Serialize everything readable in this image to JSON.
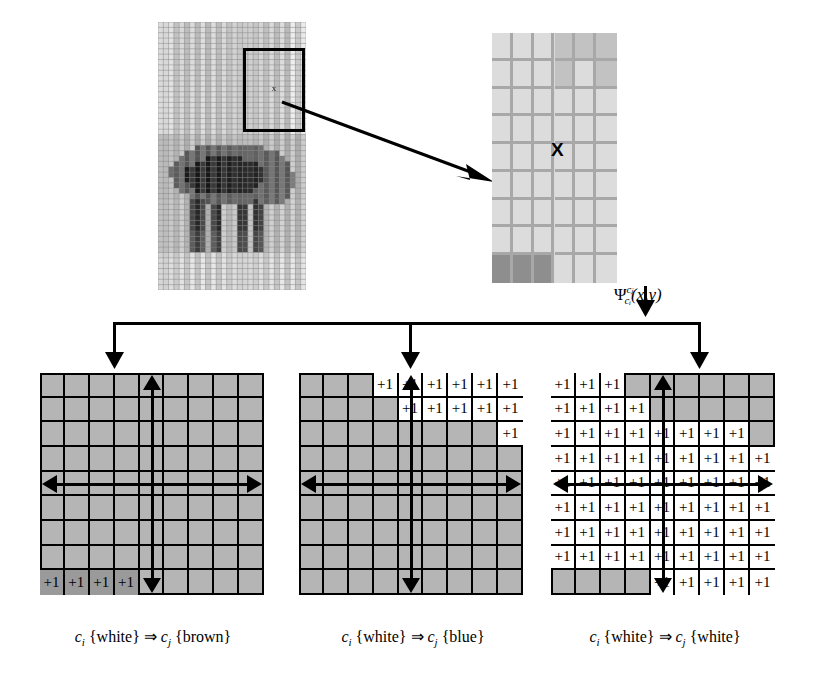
{
  "figure": {
    "operator_formula": {
      "symbol": "Ψ",
      "superscript": "cⱼ",
      "subscript": "cᵢ",
      "args": "(x,y)",
      "plain": "Ψ c_j / c_i (x,y)"
    },
    "source_image": {
      "name": "elephant-pixelated-image",
      "roi_label": "x",
      "grid_cols": 28,
      "grid_rows": 50
    },
    "zoom_panel": {
      "name": "zoomed-grid-patch",
      "center_marker": "X",
      "cols": 6,
      "rows": 9
    },
    "panels": [
      {
        "id": "brown",
        "caption_ci": "c",
        "caption_ci_sub": "i",
        "caption_from": "{white}",
        "caption_arrow": "⇒",
        "caption_cj": "c",
        "caption_cj_sub": "j",
        "caption_to": "{brown}",
        "caption_plain": "c_i {white} ⇒ c_j {brown}",
        "cell_label": "+1",
        "cell_style": "dark",
        "axis_center_col": 5,
        "axis_center_row": 5,
        "marks": [
          {
            "row": 9,
            "cols": [
              1,
              2,
              3,
              4
            ]
          }
        ]
      },
      {
        "id": "blue",
        "caption_ci": "c",
        "caption_ci_sub": "i",
        "caption_from": "{white}",
        "caption_arrow": "⇒",
        "caption_cj": "c",
        "caption_cj_sub": "j",
        "caption_to": "{blue}",
        "caption_plain": "c_i {white} ⇒ c_j {blue}",
        "cell_label": "+1",
        "cell_style": "light",
        "axis_center_col": 5,
        "axis_center_row": 5,
        "marks": [
          {
            "row": 1,
            "cols": [
              4,
              5,
              6,
              7,
              8,
              9
            ]
          },
          {
            "row": 2,
            "cols": [
              5,
              6,
              7,
              8,
              9
            ]
          },
          {
            "row": 3,
            "cols": [
              9
            ]
          }
        ]
      },
      {
        "id": "white",
        "caption_ci": "c",
        "caption_ci_sub": "i",
        "caption_from": "{white}",
        "caption_arrow": "⇒",
        "caption_cj": "c",
        "caption_cj_sub": "j",
        "caption_to": "{white}",
        "caption_plain": "c_i {white} ⇒ c_j {white}",
        "cell_label": "+1",
        "cell_style": "light",
        "axis_center_col": 5,
        "axis_center_row": 5,
        "marks": [
          {
            "row": 1,
            "cols": [
              1,
              2,
              3
            ]
          },
          {
            "row": 2,
            "cols": [
              1,
              2,
              3,
              4
            ]
          },
          {
            "row": 3,
            "cols": [
              1,
              2,
              3,
              4,
              5,
              6,
              7,
              8
            ]
          },
          {
            "row": 4,
            "cols": [
              1,
              2,
              3,
              4,
              5,
              6,
              7,
              8,
              9
            ]
          },
          {
            "row": 5,
            "cols": [
              1,
              2,
              3,
              4,
              5,
              6,
              7,
              8,
              9
            ]
          },
          {
            "row": 6,
            "cols": [
              1,
              2,
              3,
              4,
              5,
              6,
              7,
              8,
              9
            ]
          },
          {
            "row": 7,
            "cols": [
              1,
              2,
              3,
              4,
              5,
              6,
              7,
              8,
              9
            ]
          },
          {
            "row": 8,
            "cols": [
              1,
              2,
              3,
              4,
              5,
              6,
              7,
              8,
              9
            ]
          },
          {
            "row": 9,
            "cols": [
              5,
              6,
              7,
              8,
              9
            ]
          }
        ]
      }
    ],
    "colors": {
      "panel_background": "#b5b5b5",
      "cell_on": "#ffffff",
      "cell_on_dark": "#9a9a9a",
      "grid_line": "#000000",
      "zoom_background": "#d9d9d9",
      "zoom_grid_line": "#a8a8a8",
      "page_background": "#ffffff"
    },
    "grid": {
      "rows": 9,
      "cols": 9
    }
  }
}
